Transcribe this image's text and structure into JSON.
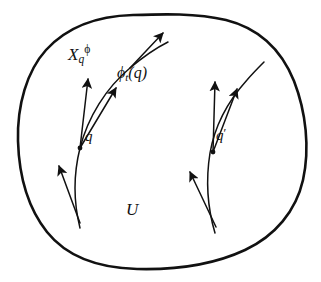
{
  "figure": {
    "background_color": "#ffffff",
    "ink_color": "#111111",
    "width": 321,
    "height": 282
  },
  "labels": {
    "vector_field_base": "X",
    "vector_field_sub": "q",
    "vector_field_sup": "ϕ",
    "flow_base": "ϕ",
    "flow_sub": "t",
    "flow_arg": "(q)",
    "point_q": "q",
    "point_q_prime_base": "q",
    "point_q_prime_mark": "′",
    "region": "U"
  },
  "geometry": {
    "region_outline": {
      "name": "open-set-U-boundary",
      "stroke_width": 2.6,
      "path": "M 133 15 C 96 16 66 28 46 50 C 27 71 17 105 18 141 C 19 175 28 208 47 232 C 67 257 99 268 137 269 C 176 270 215 264 245 250 C 275 236 296 211 303 180 C 310 148 306 112 294 81 C 281 49 258 28 226 20 C 196 13 163 14 133 15 Z"
    },
    "curves": [
      {
        "name": "integral-curve-left",
        "path": "M 80 228 C 73 200 74 172 80 148 C 88 117 106 88 130 68 C 143 57 156 48 168 42",
        "stroke_width": 1.5
      },
      {
        "name": "integral-curve-right",
        "path": "M 215 233 C 207 206 206 178 210 153 C 215 124 229 100 247 80 C 253 73 259 67 264 62",
        "stroke_width": 1.5
      }
    ],
    "arrows": [
      {
        "name": "tangent-arrow-Xq-at-q",
        "from": [
          80,
          148
        ],
        "to": [
          88,
          79
        ],
        "stroke_width": 1.5
      },
      {
        "name": "tangent-arrow-along-curve-at-q",
        "from": [
          80,
          148
        ],
        "to": [
          116,
          88
        ],
        "stroke_width": 1.5
      },
      {
        "name": "tangent-arrow-at-phi-t-q",
        "from": [
          130,
          68
        ],
        "to": [
          163,
          33
        ],
        "stroke_width": 1.5
      },
      {
        "name": "tangent-arrow-lower-left",
        "from": [
          80,
          223
        ],
        "to": [
          59,
          166
        ],
        "stroke_width": 1.5
      },
      {
        "name": "tangent-arrow-vertical-at-q-prime",
        "from": [
          213,
          152
        ],
        "to": [
          215,
          82
        ],
        "stroke_width": 1.5
      },
      {
        "name": "tangent-arrow-diagonal-at-q-prime",
        "from": [
          213,
          152
        ],
        "to": [
          237,
          89
        ],
        "stroke_width": 1.5
      },
      {
        "name": "tangent-arrow-lower-right",
        "from": [
          216,
          227
        ],
        "to": [
          190,
          172
        ],
        "stroke_width": 1.5
      }
    ],
    "points": [
      {
        "name": "point-marker-q",
        "cx": 80,
        "cy": 148,
        "r": 2.4
      },
      {
        "name": "point-marker-q-prime",
        "cx": 213,
        "cy": 152,
        "r": 2.4
      }
    ]
  }
}
